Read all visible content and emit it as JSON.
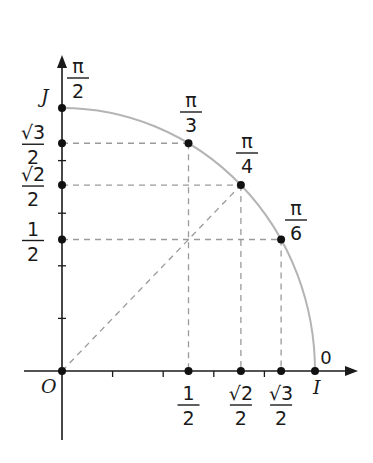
{
  "figure": {
    "origin_label": "O",
    "i_label": "I",
    "j_label": "J",
    "zero_label": "0",
    "colors": {
      "axis": "#1a1a1a",
      "arc": "#b4b4b4",
      "dashed": "#9a9a9a",
      "point": "#111111",
      "text": "#1a1a1a"
    }
  },
  "geometry": {
    "origin_px": [
      62,
      371
    ],
    "radius_x_px": 253,
    "radius_y_px": 263,
    "x_axis_end_px": 358,
    "y_axis_end_px": 55,
    "x_axis_start_px": 24,
    "y_axis_bottom_px": 440,
    "tick_step": 0.2
  },
  "angles": [
    {
      "id": "pi-over-2",
      "num": "π",
      "den": "2",
      "cos": 0,
      "sin": 1
    },
    {
      "id": "pi-over-3",
      "num": "π",
      "den": "3",
      "cos": 0.5,
      "sin": 0.866
    },
    {
      "id": "pi-over-4",
      "num": "π",
      "den": "4",
      "cos": 0.7071,
      "sin": 0.7071
    },
    {
      "id": "pi-over-6",
      "num": "π",
      "den": "6",
      "cos": 0.866,
      "sin": 0.5
    },
    {
      "id": "zero",
      "num": "0",
      "den": "",
      "cos": 1,
      "sin": 0
    }
  ],
  "x_axis_labels": [
    {
      "id": "one-half",
      "num": "1",
      "den": "2",
      "value": 0.5
    },
    {
      "id": "sqrt2-over-2",
      "num": "√2",
      "den": "2",
      "value": 0.7071
    },
    {
      "id": "sqrt3-over-2",
      "num": "√3",
      "den": "2",
      "value": 0.866
    }
  ],
  "y_axis_labels": [
    {
      "id": "sqrt3-over-2",
      "num": "√3",
      "den": "2",
      "value": 0.866
    },
    {
      "id": "sqrt2-over-2",
      "num": "√2",
      "den": "2",
      "value": 0.7071
    },
    {
      "id": "one-half",
      "num": "1",
      "den": "2",
      "value": 0.5
    }
  ]
}
